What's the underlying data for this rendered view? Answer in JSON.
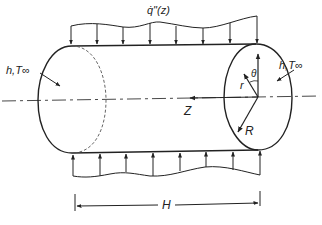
{
  "diagram": {
    "type": "cylinder-heat-conduction",
    "labels": {
      "heat_flux": "q̇\"(z)",
      "convection_left": "h,T∞",
      "convection_right": "h,T∞",
      "axial_coord": "Z",
      "radial_coord": "r",
      "angular_coord": "θ",
      "radius": "R",
      "length": "H"
    },
    "colors": {
      "stroke": "#222222",
      "background": "#ffffff"
    }
  }
}
